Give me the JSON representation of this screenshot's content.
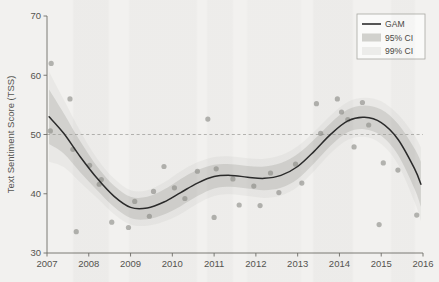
{
  "figure": {
    "background_color": "#f2f1ef",
    "plot_area": {
      "left": 47,
      "right": 423,
      "top": 16,
      "bottom": 253
    }
  },
  "axes": {
    "y_title": "Text Sentiment Score (TSS)",
    "x_title": "",
    "y_ticks": [
      "70",
      "60",
      "50",
      "40",
      "30"
    ],
    "x_ticks": [
      "2007",
      "2008",
      "2009",
      "2010",
      "2011",
      "2012",
      "2013",
      "2014",
      "2015",
      "2016"
    ]
  },
  "legend": {
    "position": "top-right",
    "items": [
      {
        "label": "GAM",
        "type": "line",
        "color": "#2b2b2b"
      },
      {
        "label": "95% CI",
        "type": "band",
        "color": "#c9c9c6"
      },
      {
        "label": "99% CI",
        "type": "band",
        "color": "#e2e2df"
      }
    ]
  },
  "annotations": {
    "reference_line": {
      "value": 50,
      "style": "dashed",
      "color": "#9a9a96"
    }
  },
  "chart_data": {
    "type": "line",
    "title": "",
    "xlabel": "",
    "ylabel": "Text Sentiment Score (TSS)",
    "xlim": [
      2007,
      2016
    ],
    "ylim": [
      30,
      70
    ],
    "ytick_values": [
      30,
      40,
      50,
      60,
      70
    ],
    "xtick_values": [
      2007,
      2008,
      2009,
      2010,
      2011,
      2012,
      2013,
      2014,
      2015,
      2016
    ],
    "grid": false,
    "legend_position": "upper right",
    "reference_line_y": 50,
    "series": [
      {
        "name": "GAM",
        "type": "line",
        "color": "#2b2b2b",
        "x": [
          2007.05,
          2007.4,
          2007.8,
          2008.2,
          2008.6,
          2009.0,
          2009.4,
          2009.8,
          2010.2,
          2010.6,
          2011.0,
          2011.4,
          2011.8,
          2012.2,
          2012.6,
          2013.0,
          2013.4,
          2013.8,
          2014.2,
          2014.6,
          2015.0,
          2015.4,
          2015.8,
          2015.95
        ],
        "values": [
          53.0,
          50.2,
          46.2,
          42.6,
          39.6,
          37.7,
          37.6,
          38.6,
          40.2,
          41.8,
          42.9,
          43.1,
          42.8,
          42.6,
          43.1,
          44.6,
          47.2,
          50.1,
          52.3,
          52.9,
          52.0,
          49.2,
          44.2,
          41.6
        ]
      },
      {
        "name": "95% CI",
        "type": "band",
        "color": "#c9c9c6",
        "x": [
          2007.05,
          2007.4,
          2007.8,
          2008.2,
          2008.6,
          2009.0,
          2009.4,
          2009.8,
          2010.2,
          2010.6,
          2011.0,
          2011.4,
          2011.8,
          2012.2,
          2012.6,
          2013.0,
          2013.4,
          2013.8,
          2014.2,
          2014.6,
          2015.0,
          2015.4,
          2015.8,
          2015.95
        ],
        "upper": [
          57.6,
          53.6,
          48.8,
          44.6,
          41.4,
          39.5,
          39.5,
          40.7,
          42.5,
          44.0,
          44.9,
          45.0,
          44.7,
          44.6,
          45.2,
          46.7,
          49.2,
          52.0,
          54.2,
          54.9,
          54.2,
          51.8,
          47.6,
          45.4
        ],
        "lower": [
          48.4,
          46.8,
          43.6,
          40.6,
          37.8,
          35.9,
          35.7,
          36.5,
          37.9,
          39.6,
          40.9,
          41.2,
          40.9,
          40.6,
          41.0,
          42.5,
          45.2,
          48.2,
          50.4,
          50.9,
          49.8,
          46.6,
          40.8,
          37.8
        ]
      },
      {
        "name": "99% CI",
        "type": "band",
        "color": "#e2e2df",
        "x": [
          2007.05,
          2007.4,
          2007.8,
          2008.2,
          2008.6,
          2009.0,
          2009.4,
          2009.8,
          2010.2,
          2010.6,
          2011.0,
          2011.4,
          2011.8,
          2012.2,
          2012.6,
          2013.0,
          2013.4,
          2013.8,
          2014.2,
          2014.6,
          2015.0,
          2015.4,
          2015.8,
          2015.95
        ],
        "upper": [
          60.6,
          55.9,
          50.5,
          45.9,
          42.6,
          40.6,
          40.6,
          41.9,
          43.8,
          45.3,
          46.2,
          46.3,
          46.0,
          45.9,
          46.5,
          48.0,
          50.5,
          53.3,
          55.5,
          56.2,
          55.6,
          53.4,
          49.8,
          47.8
        ],
        "lower": [
          45.4,
          44.5,
          41.9,
          39.3,
          36.6,
          34.8,
          34.6,
          35.3,
          36.6,
          38.3,
          39.6,
          39.9,
          39.6,
          39.3,
          39.7,
          41.2,
          43.9,
          46.9,
          49.1,
          49.6,
          48.4,
          45.0,
          38.6,
          35.4
        ]
      },
      {
        "name": "observations",
        "type": "scatter",
        "color": "#8a8a86",
        "points": [
          [
            2007.08,
            50.6
          ],
          [
            2007.1,
            62.0
          ],
          [
            2007.55,
            56.0
          ],
          [
            2007.62,
            47.5
          ],
          [
            2007.7,
            33.6
          ],
          [
            2008.02,
            44.8
          ],
          [
            2008.25,
            41.6
          ],
          [
            2008.3,
            42.4
          ],
          [
            2008.55,
            35.2
          ],
          [
            2008.95,
            34.3
          ],
          [
            2009.1,
            38.7
          ],
          [
            2009.45,
            36.2
          ],
          [
            2009.55,
            40.4
          ],
          [
            2009.8,
            44.6
          ],
          [
            2010.05,
            41.0
          ],
          [
            2010.3,
            39.2
          ],
          [
            2010.6,
            43.8
          ],
          [
            2010.85,
            52.6
          ],
          [
            2011.0,
            36.0
          ],
          [
            2011.05,
            44.2
          ],
          [
            2011.45,
            42.5
          ],
          [
            2011.6,
            38.1
          ],
          [
            2011.95,
            41.3
          ],
          [
            2012.1,
            38.0
          ],
          [
            2012.35,
            43.5
          ],
          [
            2012.55,
            40.2
          ],
          [
            2012.95,
            45.0
          ],
          [
            2013.1,
            41.8
          ],
          [
            2013.45,
            55.2
          ],
          [
            2013.55,
            50.2
          ],
          [
            2013.95,
            56.0
          ],
          [
            2014.05,
            53.8
          ],
          [
            2014.2,
            52.5
          ],
          [
            2014.35,
            47.9
          ],
          [
            2014.55,
            55.4
          ],
          [
            2014.7,
            51.6
          ],
          [
            2014.95,
            34.8
          ],
          [
            2015.05,
            45.2
          ],
          [
            2015.4,
            44.0
          ],
          [
            2015.85,
            36.4
          ]
        ]
      }
    ]
  }
}
